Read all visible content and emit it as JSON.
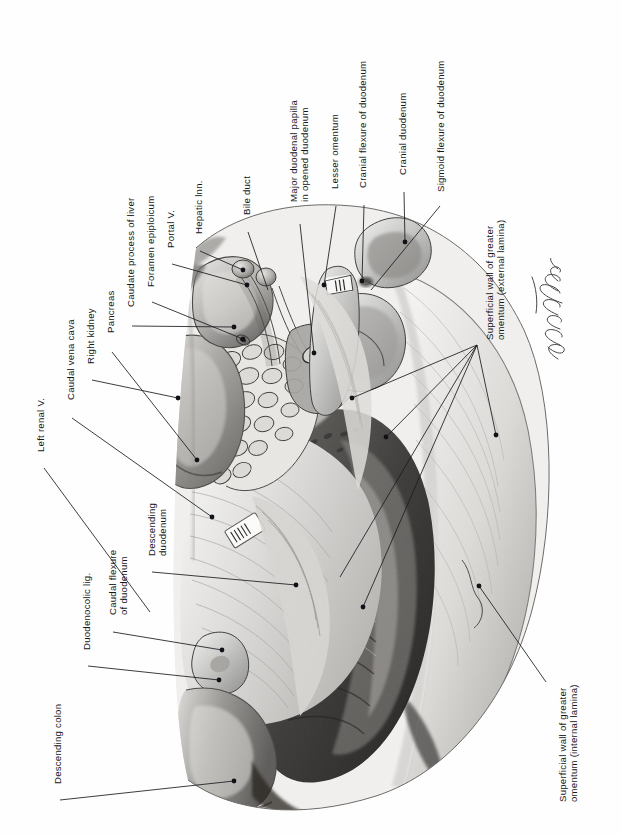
{
  "figure": {
    "medium": "graphite pencil anatomical illustration",
    "background_color": "#fefefe",
    "ink_color": "#15161a",
    "signature": "R. O. Mustadera",
    "orientation": "labels rotated 90 degrees counter-clockwise"
  },
  "labels": [
    {
      "id": "left-renal-v",
      "text": "Left renal V.",
      "x": 36,
      "y": 452,
      "lines": 1
    },
    {
      "id": "caudal-vena-cava",
      "text": "Caudal vena cava",
      "x": 66,
      "y": 400,
      "lines": 1
    },
    {
      "id": "right-kidney",
      "text": "Right kidney",
      "x": 86,
      "y": 364,
      "lines": 1
    },
    {
      "id": "pancreas",
      "text": "Pancreas",
      "x": 106,
      "y": 333,
      "lines": 1
    },
    {
      "id": "caudate-process-liver",
      "text": "Caudate process of liver",
      "x": 126,
      "y": 307,
      "lines": 1
    },
    {
      "id": "foramen-epiploicum",
      "text": "Foramen epiploicum",
      "x": 146,
      "y": 287,
      "lines": 1
    },
    {
      "id": "portal-v",
      "text": "Portal V.",
      "x": 166,
      "y": 248,
      "lines": 1
    },
    {
      "id": "hepatic-lnn",
      "text": "Hepatic lnn.",
      "x": 194,
      "y": 234,
      "lines": 1
    },
    {
      "id": "bile-duct",
      "text": "Bile duct",
      "x": 242,
      "y": 215,
      "lines": 1
    },
    {
      "id": "major-duodenal-papilla",
      "text": "Major duodenal papilla\nin opened duodenum",
      "x": 288,
      "y": 202,
      "lines": 2
    },
    {
      "id": "lesser-omentum",
      "text": "Lesser omentum",
      "x": 330,
      "y": 189,
      "lines": 1
    },
    {
      "id": "cranial-flexure",
      "text": "Cranial flexure of duodenum",
      "x": 358,
      "y": 188,
      "lines": 1
    },
    {
      "id": "cranial-duodenum",
      "text": "Cranial duodenum",
      "x": 398,
      "y": 175,
      "lines": 1
    },
    {
      "id": "sigmoid-flexure",
      "text": "Sigmoid flexure of duodenum",
      "x": 436,
      "y": 192,
      "lines": 1
    },
    {
      "id": "superficial-wall-external",
      "text": "Superficial wall of greater\nomentum (external lamina)",
      "x": 484,
      "y": 340,
      "lines": 2
    },
    {
      "id": "superficial-wall-internal",
      "text": "Superficial wall of greater\nomentum (internal lamina)",
      "x": 557,
      "y": 802,
      "lines": 2
    },
    {
      "id": "descending-colon",
      "text": "Descending colon",
      "x": 53,
      "y": 784,
      "lines": 1
    },
    {
      "id": "duodenocolic-lig",
      "text": "Duodenocolic lig.",
      "x": 82,
      "y": 650,
      "lines": 1
    },
    {
      "id": "caudal-flexure",
      "text": "Caudal flexure\nof duodenum",
      "x": 107,
      "y": 615,
      "lines": 2
    },
    {
      "id": "descending-duodenum",
      "text": "Descending\nduodenum",
      "x": 146,
      "y": 556,
      "lines": 2
    }
  ],
  "leaders": [
    {
      "id": "left-renal-v",
      "path": "M 44 468 L 150 612",
      "dot": null
    },
    {
      "id": "caudal-vena-cava",
      "path": "M 72 418 L 212 517",
      "dot": [
        212,
        517
      ]
    },
    {
      "id": "right-kidney",
      "path": "M 92 380 L 178 398",
      "dot": [
        178,
        398
      ]
    },
    {
      "id": "pancreas",
      "path": "M 112 352 L 197 460",
      "dot": [
        197,
        460
      ]
    },
    {
      "id": "caudate-process-liver",
      "path": "M 132 326 L 234 327",
      "dot": [
        234,
        327
      ]
    },
    {
      "id": "foramen-epiploicum",
      "path": "M 152 302 L 243 339",
      "dot": [
        243,
        339
      ]
    },
    {
      "id": "portal-v",
      "path": "M 172 264 L 247 285",
      "dot": [
        247,
        285
      ]
    },
    {
      "id": "hepatic-lnn",
      "path": "M 200 251 L 243 270",
      "dot": [
        243,
        270
      ]
    },
    {
      "id": "bile-duct",
      "path": "M 248 232 L 268 290",
      "dot": null
    },
    {
      "id": "major-duodenal-papilla",
      "path": "M 300 224 L 314 353",
      "dot": [
        314,
        353
      ]
    },
    {
      "id": "lesser-omentum",
      "path": "M 336 206 L 324 285",
      "dot": [
        324,
        285
      ]
    },
    {
      "id": "cranial-flexure",
      "path": "M 364 205 L 362 281",
      "dot": [
        362,
        281
      ]
    },
    {
      "id": "cranial-duodenum",
      "path": "M 404 192 L 405 242",
      "dot": [
        405,
        242
      ]
    },
    {
      "id": "sigmoid-flexure",
      "path": "M 440 206 L 371 290",
      "dot": null
    },
    {
      "id": "omentum-ext-1",
      "path": "M 477 345 L 352 398",
      "dot": [
        352,
        398
      ]
    },
    {
      "id": "omentum-ext-2",
      "path": "M 477 345 L 386 437",
      "dot": [
        386,
        437
      ]
    },
    {
      "id": "omentum-ext-3",
      "path": "M 477 345 L 340 577",
      "dot": null
    },
    {
      "id": "omentum-ext-4",
      "path": "M 477 345 L 363 607",
      "dot": [
        363,
        607
      ]
    },
    {
      "id": "omentum-ext-5",
      "path": "M 477 345 L 496 435",
      "dot": [
        496,
        435
      ]
    },
    {
      "id": "omentum-int",
      "path": "M 546 682 L 479 586",
      "dot": [
        479,
        586
      ]
    },
    {
      "id": "descending-colon",
      "path": "M 60 800 L 234 781",
      "dot": [
        234,
        781
      ]
    },
    {
      "id": "duodenocolic-lig",
      "path": "M 88 666 L 219 680",
      "dot": [
        219,
        680
      ]
    },
    {
      "id": "caudal-flexure",
      "path": "M 113 632 L 222 650",
      "dot": [
        222,
        650
      ]
    },
    {
      "id": "descending-duodenum",
      "path": "M 152 572 L 296 585",
      "dot": [
        296,
        585
      ]
    }
  ]
}
